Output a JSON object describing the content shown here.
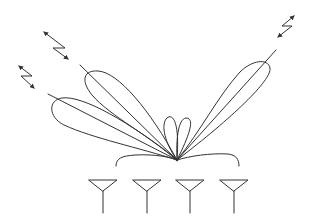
{
  "diagram": {
    "title": "",
    "description": "Antenna array beamforming radiation pattern with steered main lobes toward remote terminals",
    "colors": {
      "stroke": "#333333",
      "background": "#ffffff"
    },
    "focal_point": {
      "x": 177,
      "y": 160
    },
    "antenna_array": {
      "count": 4,
      "elements": [
        {
          "id": "antenna-1",
          "x": 103
        },
        {
          "id": "antenna-2",
          "x": 147
        },
        {
          "id": "antenna-3",
          "x": 190
        },
        {
          "id": "antenna-4",
          "x": 234
        }
      ]
    },
    "lobes": [
      {
        "id": "lobe-far-left",
        "type": "main",
        "direction": "upper-left (shallow)"
      },
      {
        "id": "lobe-mid-left",
        "type": "main",
        "direction": "upper-left (steep)"
      },
      {
        "id": "lobe-center-left",
        "type": "side",
        "direction": "up"
      },
      {
        "id": "lobe-center-right",
        "type": "side",
        "direction": "up"
      },
      {
        "id": "lobe-right",
        "type": "main",
        "direction": "upper-right"
      }
    ],
    "signal_symbols": [
      {
        "id": "signal-left-lower",
        "icon": "bidirectional-lightning-arrow"
      },
      {
        "id": "signal-left-upper",
        "icon": "bidirectional-lightning-arrow"
      },
      {
        "id": "signal-right",
        "icon": "bidirectional-lightning-arrow"
      }
    ],
    "bracket": {
      "label": ""
    }
  }
}
